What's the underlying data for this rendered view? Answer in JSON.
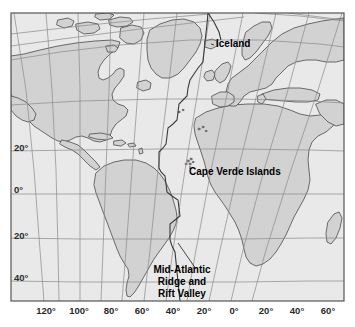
{
  "figure": {
    "type": "map",
    "projection": "conic",
    "region": "Atlantic Ocean",
    "width": 355,
    "height": 327,
    "background_color": "#ffffff"
  },
  "map": {
    "frame": {
      "x": 11,
      "y": 13,
      "width": 333,
      "height": 288
    },
    "ocean_color": "#e9e9e9",
    "land_color": "#d2d2d2",
    "coast_color": "#4a4a4a",
    "graticule_color": "#8a8a8a",
    "ridge_color": "#3a3a3a",
    "frame_color": "#555555"
  },
  "labels": [
    {
      "id": "iceland",
      "text": "Iceland",
      "x": 216,
      "y": 47,
      "anchor": "start",
      "size": 10
    },
    {
      "id": "cape-verde-islands",
      "text": "Cape Verde Islands",
      "x": 189,
      "y": 175,
      "anchor": "start",
      "size": 10
    },
    {
      "id": "mid-atlantic-ridge-line1",
      "text": "Mid-Atlantic",
      "x": 182,
      "y": 273,
      "anchor": "middle",
      "size": 10
    },
    {
      "id": "mid-atlantic-ridge-line2",
      "text": "Ridge and",
      "x": 182,
      "y": 285,
      "anchor": "middle",
      "size": 10
    },
    {
      "id": "mid-atlantic-ridge-line3",
      "text": "Rift Valley",
      "x": 182,
      "y": 297,
      "anchor": "middle",
      "size": 10
    }
  ],
  "axes": {
    "longitude": {
      "title": "Longitude",
      "unit": "degrees",
      "ticks": [
        {
          "label": "120°",
          "value": -120,
          "x": 46,
          "y": 312
        },
        {
          "label": "100°",
          "value": -100,
          "x": 79,
          "y": 312
        },
        {
          "label": "80°",
          "value": -80,
          "x": 111,
          "y": 312
        },
        {
          "label": "60°",
          "value": -60,
          "x": 141,
          "y": 312
        },
        {
          "label": "40°",
          "value": -40,
          "x": 172,
          "y": 312
        },
        {
          "label": "20°",
          "value": -20,
          "x": 203,
          "y": 312
        },
        {
          "label": "0°",
          "value": 0,
          "x": 233,
          "y": 312
        },
        {
          "label": "20°",
          "value": 20,
          "x": 265,
          "y": 312
        },
        {
          "label": "40°",
          "value": 40,
          "x": 296,
          "y": 312
        },
        {
          "label": "60°",
          "value": 60,
          "x": 327,
          "y": 312
        }
      ]
    },
    "latitude": {
      "title": "Latitude",
      "unit": "degrees",
      "ticks": [
        {
          "label": "20°",
          "value": 20,
          "x": 14,
          "y": 151
        },
        {
          "label": "0°",
          "value": 0,
          "x": 14,
          "y": 193
        },
        {
          "label": "20°",
          "value": -20,
          "x": 14,
          "y": 239
        },
        {
          "label": "40°",
          "value": -40,
          "x": 14,
          "y": 281
        }
      ]
    }
  },
  "features": {
    "landmasses": [
      "North America",
      "Greenland",
      "South America",
      "Africa",
      "Europe",
      "Iceland",
      "British Isles",
      "Caribbean Islands",
      "Cape Verde Islands"
    ],
    "tectonic": [
      "Mid-Atlantic Ridge",
      "Rift Valley",
      "Transform faults"
    ]
  }
}
